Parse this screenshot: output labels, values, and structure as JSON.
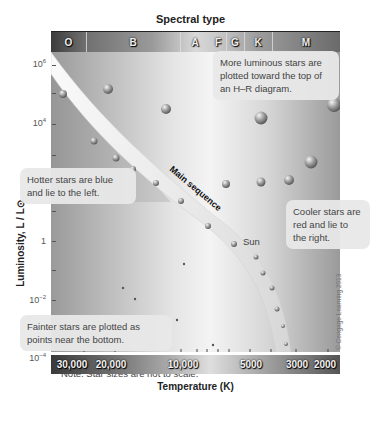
{
  "diagram": {
    "title": "Spectral type",
    "spectral_types": [
      {
        "label": "O"
      },
      {
        "label": "B"
      },
      {
        "label": "A"
      },
      {
        "label": "F"
      },
      {
        "label": "G"
      },
      {
        "label": "K"
      },
      {
        "label": "M"
      }
    ],
    "y_axis": {
      "label": "Luminosity, L / L⊙",
      "ticks": [
        {
          "base": "10",
          "exp": "6"
        },
        {
          "base": "10",
          "exp": "4"
        },
        {
          "base": "1",
          "exp": ""
        },
        {
          "base": "10",
          "exp": "−2"
        },
        {
          "base": "10",
          "exp": "−4"
        }
      ]
    },
    "x_axis": {
      "label": "Temperature (K)",
      "ticks": [
        "30,000",
        "20,000",
        "10,000",
        "5000",
        "3000",
        "2000"
      ]
    },
    "main_sequence_label": "Main sequence",
    "sun_label": "Sun",
    "callouts": {
      "luminous": "More luminous stars are plotted toward the top of an H–R diagram.",
      "hotter": "Hotter stars are blue and lie to the left.",
      "cooler": "Cooler stars are red and lie to the right.",
      "fainter": "Fainter stars are plotted as points near the bottom."
    },
    "note": "Note: Star sizes are not to scale.",
    "copyright": "© Cengage Learning 2013"
  }
}
